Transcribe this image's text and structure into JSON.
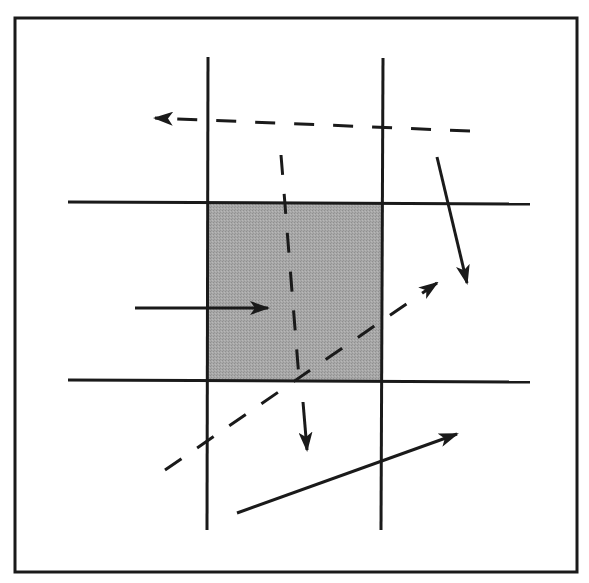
{
  "diagram": {
    "title": "",
    "canvas": {
      "width": 589,
      "height": 583,
      "background": "#ffffff"
    },
    "colors": {
      "stroke": "#1a1a1a",
      "region_fill": "#a8a8a8",
      "frame": "#1a1a1a"
    },
    "frame": {
      "x1": 15,
      "y1": 18,
      "x2": 577,
      "y2": 572
    },
    "clip_window": {
      "x1": 208,
      "y1": 202,
      "x2": 382,
      "y2": 380,
      "shaded": true
    },
    "grid_lines": [
      {
        "id": "left-boundary",
        "orientation": "vertical",
        "x1": 208,
        "y1": 57,
        "x2": 207,
        "y2": 530
      },
      {
        "id": "right-boundary",
        "orientation": "vertical",
        "x1": 383,
        "y1": 58,
        "x2": 381,
        "y2": 530
      },
      {
        "id": "top-boundary",
        "orientation": "horizontal",
        "x1": 68,
        "y1": 202,
        "x2": 530,
        "y2": 204
      },
      {
        "id": "bottom-boundary",
        "orientation": "horizontal",
        "x1": 68,
        "y1": 380,
        "x2": 530,
        "y2": 382
      }
    ],
    "segments": [
      {
        "id": "dashed-top-leftward",
        "style": "dashed",
        "x1": 470,
        "y1": 131,
        "x2": 168,
        "y2": 119,
        "arrow_end": true,
        "arrow_tip": [
          155,
          118
        ]
      },
      {
        "id": "dashed-vertical-through-window",
        "style": "dashed",
        "x1": 281,
        "y1": 155,
        "x2": 299,
        "y2": 378,
        "arrow_end": false
      },
      {
        "id": "solid-right-downward",
        "style": "solid",
        "x1": 437,
        "y1": 157,
        "x2": 467,
        "y2": 283,
        "arrow_end": true
      },
      {
        "id": "solid-into-window",
        "style": "solid",
        "x1": 135,
        "y1": 308,
        "x2": 268,
        "y2": 308,
        "arrow_end": true
      },
      {
        "id": "dashed-diagonal-upward",
        "style": "dashed",
        "x1": 165,
        "y1": 470,
        "x2": 437,
        "y2": 283,
        "arrow_end": true
      },
      {
        "id": "solid-short-downward",
        "style": "solid",
        "x1": 303,
        "y1": 402,
        "x2": 307,
        "y2": 450,
        "arrow_end": true
      },
      {
        "id": "solid-bottom-rightward",
        "style": "solid",
        "x1": 237,
        "y1": 513,
        "x2": 457,
        "y2": 434,
        "arrow_end": true
      }
    ]
  }
}
